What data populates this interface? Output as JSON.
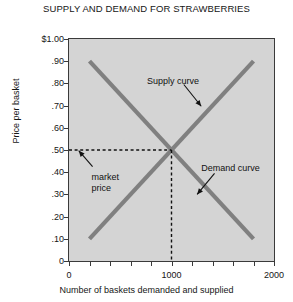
{
  "chart_data": {
    "type": "line",
    "title": "SUPPLY AND DEMAND FOR STRAWBERRIES",
    "xlabel": "Number of baskets demanded and supplied",
    "ylabel": "Price per basket",
    "xlim": [
      0,
      2000
    ],
    "ylim": [
      0,
      1.0
    ],
    "grid": false,
    "legend": "none (inline curve labels with arrows)",
    "x_ticks": [
      0,
      200,
      400,
      600,
      800,
      1000,
      1200,
      1400,
      1600,
      1800,
      2000
    ],
    "x_tick_labels": [
      "0",
      "",
      "",
      "",
      "",
      "1000",
      "",
      "",
      "",
      "",
      "2000"
    ],
    "y_ticks": [
      0,
      0.1,
      0.2,
      0.3,
      0.4,
      0.5,
      0.6,
      0.7,
      0.8,
      0.9,
      1.0
    ],
    "y_tick_labels": [
      "0",
      ".10",
      ".20",
      ".30",
      ".40",
      ".50",
      ".60",
      ".70",
      ".80",
      ".90",
      "$1.00"
    ],
    "series": [
      {
        "name": "Supply curve",
        "points": [
          [
            200,
            0.1
          ],
          [
            1800,
            0.9
          ]
        ],
        "color": "#808080"
      },
      {
        "name": "Demand curve",
        "points": [
          [
            200,
            0.9
          ],
          [
            1800,
            0.1
          ]
        ],
        "color": "#808080"
      }
    ],
    "equilibrium": {
      "quantity": 1000,
      "price": 0.5,
      "label": "market price"
    },
    "annotations": [
      {
        "name": "supply-curve-label",
        "text": "Supply curve",
        "target": [
          1300,
          0.7
        ]
      },
      {
        "name": "demand-curve-label",
        "text": "Demand curve",
        "target": [
          1300,
          0.3
        ]
      },
      {
        "name": "market-price-label",
        "text_line1": "market",
        "text_line2": "price",
        "target": [
          0,
          0.5
        ]
      }
    ]
  },
  "chart": {
    "title": "SUPPLY AND DEMAND FOR STRAWBERRIES",
    "xaxis_title": "Number of baskets demanded and supplied",
    "yaxis_title": "Price per basket",
    "supply_label": "Supply curve",
    "demand_label": "Demand curve",
    "market_price_line1": "market",
    "market_price_line2": "price"
  },
  "colors": {
    "plot_background": "#d4d4d4",
    "curve": "#808080",
    "axis": "#3a3a3a",
    "text": "#161616"
  }
}
